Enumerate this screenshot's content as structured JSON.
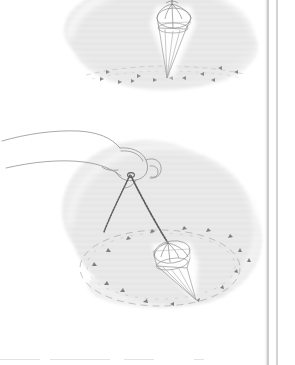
{
  "page": {
    "kind": "scanned-book-page",
    "background_color": "#ffffff",
    "width": 295,
    "height": 365,
    "paper_tone": "#ffffff"
  },
  "colors": {
    "ink": "#6e6e6e",
    "ink_light": "#9a9a9a",
    "ink_faint": "#c0c0c0",
    "wash_fill": "#ebebeb",
    "wash_stripe": "#e1e1e1",
    "chain_dark": "#5a5a5a",
    "margin_rule": "#b8b8b8",
    "halo": "#ffffff"
  },
  "figures": [
    {
      "id": "figure-top",
      "name": "pendulum-swinging-figure",
      "caption": "",
      "wash": {
        "cx": 163,
        "cy": 38,
        "rx": 92,
        "ry": 52
      },
      "pendulum": {
        "name": "crystal-pendulum",
        "apex_x": 172,
        "apex_y": 2,
        "tip_x": 167,
        "tip_y": 78,
        "crown_cx": 174,
        "crown_cy": 18,
        "crown_rx": 17,
        "crown_ry": 10
      },
      "motion_path": {
        "type": "line-swing",
        "cx": 163,
        "cy": 72,
        "rx": 80,
        "ry": 7,
        "direction": "back-and-forth"
      },
      "markers": 12
    },
    {
      "id": "figure-bottom",
      "name": "hand-holding-pendulum-figure",
      "caption": "",
      "wash": {
        "cx": 163,
        "cy": 225,
        "rx": 92,
        "ry": 78
      },
      "hand": {
        "name": "hand-outline",
        "wrist_x": 4,
        "wrist_y": 140,
        "knuckle_x": 120,
        "knuckle_y": 155
      },
      "chain": {
        "name": "beaded-chain",
        "grip_x": 130,
        "grip_y": 175,
        "slack_end_x": 104,
        "slack_end_y": 232,
        "taut_end_x": 168,
        "taut_end_y": 243
      },
      "pendulum": {
        "name": "crystal-pendulum",
        "apex_x": 168,
        "apex_y": 243,
        "tip_x": 196,
        "tip_y": 300,
        "crown_cx": 172,
        "crown_cy": 252,
        "crown_rx": 18,
        "crown_ry": 11
      },
      "motion_path": {
        "type": "ellipse-orbit",
        "cx": 160,
        "cy": 268,
        "rx": 80,
        "ry": 38,
        "direction": "clockwise"
      },
      "markers": 16
    }
  ],
  "margin_rules": [
    {
      "name": "margin-rule-inner",
      "x": 268,
      "y1": 0,
      "y2": 365
    },
    {
      "name": "margin-rule-outer",
      "x": 277,
      "y1": 0,
      "y2": 365
    }
  ],
  "bottom_rule": {
    "name": "page-bottom-rule",
    "y": 359
  }
}
